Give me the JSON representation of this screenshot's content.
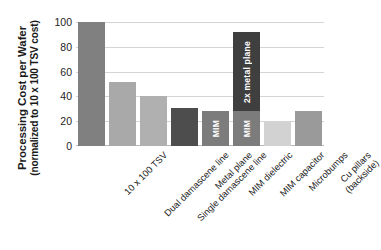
{
  "chart_data": {
    "type": "bar",
    "title": "",
    "subtitle": "",
    "ylabel_main": "Processing Cost per Wafer",
    "ylabel_sub": "(normalized to 10 x 100 TSV cost)",
    "xlabel": "",
    "ylim": [
      0,
      100
    ],
    "yticks": [
      100,
      80,
      60,
      40,
      20,
      0
    ],
    "grid": true,
    "legend": "none",
    "categories": [
      "10 x 100 TSV",
      "Dual damascene line",
      "Single damascene line",
      "Metal plane",
      "MIM dielectric",
      "MIM capacitor",
      "Microbumps",
      "Cu pillars (backside)"
    ],
    "category_lines": [
      [
        "10 x 100 TSV"
      ],
      [
        "Dual damascene line"
      ],
      [
        "Single damascene line"
      ],
      [
        "Metal plane"
      ],
      [
        "MIM dielectric"
      ],
      [
        "MIM capacitor"
      ],
      [
        "Microbumps"
      ],
      [
        "Cu pillars",
        "(backside)"
      ]
    ],
    "values": [
      100,
      52,
      40,
      31,
      28,
      92,
      19,
      28
    ],
    "bars": [
      {
        "category": "10 x 100 TSV",
        "total": 100,
        "segments": [
          {
            "value": 100,
            "label": "",
            "color": "#808080",
            "texture": "solid"
          }
        ]
      },
      {
        "category": "Dual damascene line",
        "total": 52,
        "segments": [
          {
            "value": 52,
            "label": "",
            "color": "#a9a9a9",
            "texture": "solid"
          }
        ]
      },
      {
        "category": "Single damascene line",
        "total": 40,
        "segments": [
          {
            "value": 40,
            "label": "",
            "color": "#b0b0b0",
            "texture": "solid"
          }
        ]
      },
      {
        "category": "Metal plane",
        "total": 31,
        "segments": [
          {
            "value": 31,
            "label": "",
            "color": "#4d4d4d",
            "texture": "solid"
          }
        ]
      },
      {
        "category": "MIM dielectric",
        "total": 28,
        "segments": [
          {
            "value": 28,
            "label": "MIM",
            "color": "#7c7c7c",
            "texture": "dots"
          }
        ]
      },
      {
        "category": "MIM capacitor",
        "total": 92,
        "segments": [
          {
            "value": 28,
            "label": "MIM",
            "color": "#7c7c7c",
            "texture": "dots"
          },
          {
            "value": 64,
            "label": "2x metal plane",
            "color": "#3f3f3f",
            "texture": "solid"
          }
        ]
      },
      {
        "category": "Microbumps",
        "total": 19,
        "segments": [
          {
            "value": 19,
            "label": "",
            "color": "#d2d2d2",
            "texture": "dots"
          }
        ]
      },
      {
        "category": "Cu pillars (backside)",
        "total": 28,
        "segments": [
          {
            "value": 28,
            "label": "",
            "color": "#9a9a9a",
            "texture": "dots"
          }
        ]
      }
    ]
  }
}
